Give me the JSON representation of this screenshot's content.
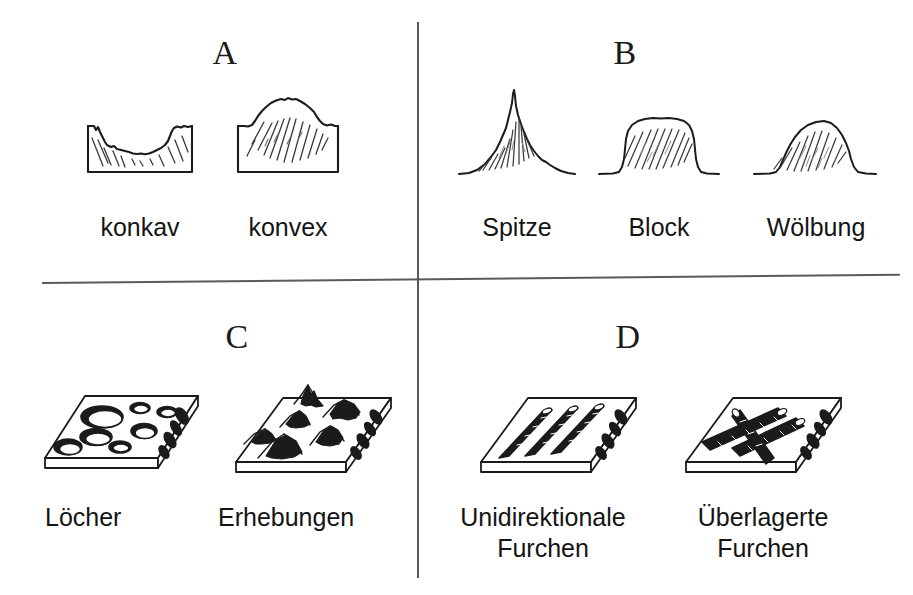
{
  "figure": {
    "title_present": false,
    "background_color": "#ffffff",
    "ink_color": "#141414",
    "divider_color": "#5a5a5a",
    "width": 913,
    "height": 595
  },
  "panels": [
    {
      "letter": "A",
      "quadrant": "top-left",
      "items": [
        {
          "label": "konkav",
          "icon": "concave-profile-cross-section"
        },
        {
          "label": "konvex",
          "icon": "convex-profile-cross-section"
        }
      ]
    },
    {
      "letter": "B",
      "quadrant": "top-right",
      "items": [
        {
          "label": "Spitze",
          "icon": "peak-profile"
        },
        {
          "label": "Block",
          "icon": "block-profile"
        },
        {
          "label": "Wölbung",
          "icon": "dome-profile"
        }
      ]
    },
    {
      "letter": "C",
      "quadrant": "bottom-left",
      "items": [
        {
          "label": "Löcher",
          "icon": "plate-with-holes"
        },
        {
          "label": "Erhebungen",
          "icon": "plate-with-bumps"
        }
      ]
    },
    {
      "letter": "D",
      "quadrant": "bottom-right",
      "items": [
        {
          "label": "Unidirektionale\nFurchen",
          "icon": "plate-with-parallel-grooves"
        },
        {
          "label": "Überlagerte\nFurchen",
          "icon": "plate-with-crossed-grooves"
        }
      ]
    }
  ]
}
